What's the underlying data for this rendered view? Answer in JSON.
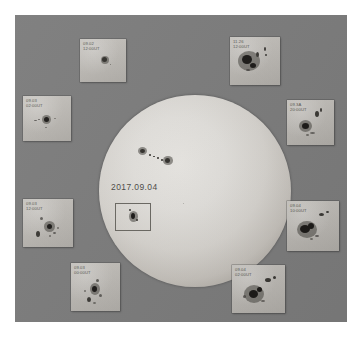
{
  "figure": {
    "type": "solar-disk-observation",
    "background_color": "#7c7c7c",
    "border_color": "#ffffff",
    "disk_color": "#e2e0dc",
    "panel_color": "#bdbab5",
    "spot_color": "#1c1a18"
  },
  "disk": {
    "date_label": "2017.09.04",
    "highlight_box_label": "active-region-box"
  },
  "panels": [
    {
      "id": "panel-top-left",
      "date": "09.02",
      "time": "12:00UT",
      "position": "top-left"
    },
    {
      "id": "panel-top-right",
      "date": "11.26",
      "time": "12:00UT",
      "position": "top-right"
    },
    {
      "id": "panel-left-upper",
      "date": "09.03",
      "time": "02:00UT",
      "position": "left-upper"
    },
    {
      "id": "panel-right-upper",
      "date": "09.3A",
      "time": "20:00UT",
      "position": "right-upper"
    },
    {
      "id": "panel-left-lower",
      "date": "09.03",
      "time": "12:00UT",
      "position": "left-lower"
    },
    {
      "id": "panel-right-lower",
      "date": "09.04",
      "time": "10:00UT",
      "position": "right-lower"
    },
    {
      "id": "panel-bottom-left",
      "date": "09.03",
      "time": "00:00UT",
      "position": "bottom-left"
    },
    {
      "id": "panel-bottom-right",
      "date": "09.04",
      "time": "02:00UT",
      "position": "bottom-right"
    }
  ]
}
